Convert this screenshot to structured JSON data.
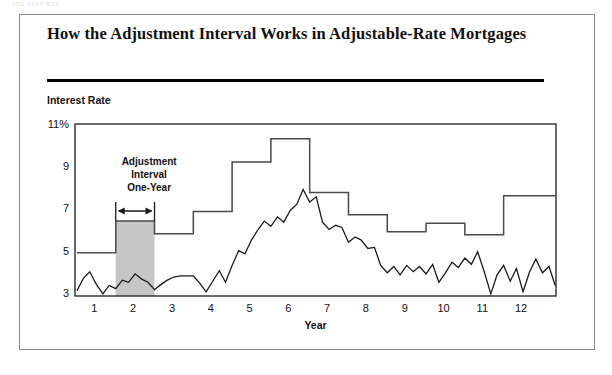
{
  "scan_fragment": "THE FACT BOX",
  "title": "How the Adjustment Interval Works in Adjustable-Rate Mortgages",
  "y_axis_title": "Interest Rate",
  "annotation": {
    "line1": "Adjustment",
    "line2": "Interval",
    "line3": "One-Year",
    "arrow": "double-headed-arrow"
  },
  "chart_data": {
    "type": "line",
    "title": "How the Adjustment Interval Works in Adjustable-Rate Mortgages",
    "xlabel": "Year",
    "ylabel": "Interest Rate",
    "xlim": [
      0.5,
      12.9
    ],
    "ylim": [
      2.85,
      11
    ],
    "grid": false,
    "legend": "none",
    "y_ticks": [
      3,
      5,
      7,
      9,
      11
    ],
    "y_tick_labels": [
      "3",
      "5",
      "7",
      "9",
      "11%"
    ],
    "x_ticks": [
      1,
      2,
      3,
      4,
      5,
      6,
      7,
      8,
      9,
      10,
      11,
      12
    ],
    "x_tick_labels": [
      "1",
      "2",
      "3",
      "4",
      "5",
      "6",
      "7",
      "8",
      "9",
      "10",
      "11",
      "12"
    ],
    "highlight_band": {
      "label": "Adjustment Interval One-Year",
      "x_start": 1.55,
      "x_end": 2.55,
      "y_top": 6.4,
      "y_bottom": 2.85,
      "fill": "#c6c6c6"
    },
    "series": [
      {
        "name": "ARM rate (annual adjustment, step)",
        "type": "step",
        "color": "#4a4a4a",
        "x": [
          0.55,
          1.55,
          2.55,
          3.55,
          4.55,
          5.55,
          6.55,
          7.55,
          8.55,
          9.55,
          10.55,
          11.55,
          12.9
        ],
        "values": [
          4.9,
          6.4,
          5.8,
          6.85,
          9.2,
          10.3,
          7.75,
          6.7,
          5.9,
          6.3,
          5.75,
          7.6,
          7.6
        ]
      },
      {
        "name": "Index rate (monthly)",
        "type": "line",
        "color": "#1a1a1a",
        "x": [
          0.55,
          0.72,
          0.88,
          1.05,
          1.22,
          1.38,
          1.55,
          1.72,
          1.88,
          2.05,
          2.22,
          2.38,
          2.55,
          2.72,
          2.88,
          3.05,
          3.22,
          3.38,
          3.55,
          3.72,
          3.88,
          4.05,
          4.22,
          4.38,
          4.55,
          4.72,
          4.88,
          5.05,
          5.22,
          5.38,
          5.55,
          5.72,
          5.88,
          6.05,
          6.22,
          6.38,
          6.55,
          6.72,
          6.88,
          7.05,
          7.22,
          7.38,
          7.55,
          7.72,
          7.88,
          8.05,
          8.22,
          8.38,
          8.55,
          8.72,
          8.88,
          9.05,
          9.22,
          9.38,
          9.55,
          9.72,
          9.88,
          10.05,
          10.22,
          10.38,
          10.55,
          10.72,
          10.88,
          11.05,
          11.22,
          11.38,
          11.55,
          11.72,
          11.88,
          12.05,
          12.22,
          12.38,
          12.55,
          12.72,
          12.88
        ],
        "values": [
          3.1,
          3.7,
          4.0,
          3.4,
          2.95,
          3.35,
          3.2,
          3.6,
          3.5,
          3.9,
          3.65,
          3.5,
          3.15,
          3.4,
          3.6,
          3.75,
          3.8,
          3.8,
          3.8,
          3.45,
          3.05,
          3.55,
          4.05,
          3.5,
          4.3,
          5.0,
          4.85,
          5.5,
          6.0,
          6.4,
          6.15,
          6.6,
          6.35,
          6.9,
          7.2,
          7.9,
          7.3,
          7.55,
          6.35,
          6.0,
          6.2,
          6.1,
          5.4,
          5.65,
          5.5,
          5.1,
          5.15,
          4.3,
          3.95,
          4.25,
          3.85,
          4.3,
          4.0,
          4.25,
          3.9,
          4.35,
          3.5,
          3.95,
          4.45,
          4.2,
          4.65,
          4.35,
          4.95,
          4.0,
          2.95,
          3.85,
          4.3,
          3.55,
          4.15,
          3.05,
          4.0,
          4.6,
          3.95,
          4.25,
          3.35
        ]
      }
    ]
  }
}
